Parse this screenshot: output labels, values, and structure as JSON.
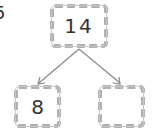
{
  "question_number": "5",
  "number_bond": {
    "whole": "14",
    "parts": [
      "8",
      ""
    ]
  },
  "colors": {
    "box_border": "#b0b0b0",
    "line": "#888888",
    "text": "#333333"
  }
}
